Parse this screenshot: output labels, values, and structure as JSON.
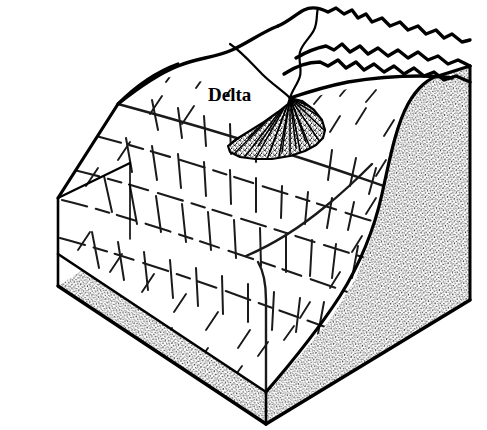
{
  "figure": {
    "kind": "geological block diagram",
    "background_color": "#ffffff",
    "ink_color": "#000000"
  },
  "labels": [
    {
      "id": "delta",
      "text": "Delta",
      "x": 208,
      "y": 101,
      "font_weight": "bold",
      "font_style": "serif",
      "font_size_px": 19
    }
  ],
  "features": {
    "delta_fan": {
      "name": "delta-fan",
      "description": "stippled radiating fan deposit at mouth of stream",
      "apex_x": 290,
      "apex_y": 98,
      "fill_style": "stipple"
    },
    "river_channel": {
      "name": "river-channel",
      "description": "stream winding down from back ridges to the delta apex"
    },
    "mountain_ridges": {
      "name": "mountain-ridges",
      "description": "jagged ridge crest lines along the back of the block"
    },
    "basin_slope": {
      "name": "basin-slope",
      "description": "sloping basin floor marked with dashed contour and dip lines"
    },
    "cut_face_right": {
      "name": "cut-face-right",
      "description": "stippled cross-section face on the right side of the block",
      "fill_style": "stipple"
    },
    "cut_face_front": {
      "name": "cut-face-front",
      "description": "narrow stippled cross-section band along the front-left base",
      "fill_style": "stipple"
    }
  },
  "geometry": {
    "block_outline": "M 58,198 L 178,14 L 470,66 L 470,300 L 266,424 L 58,286 Z",
    "top_left_corner": {
      "x": 58,
      "y": 198
    },
    "bottom_left_corner": {
      "x": 58,
      "y": 286
    },
    "bottom_front_corner": {
      "x": 266,
      "y": 424
    },
    "right_corner": {
      "x": 470,
      "y": 300
    }
  }
}
